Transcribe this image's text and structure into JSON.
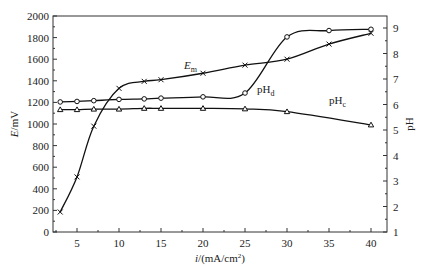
{
  "chart_data": {
    "type": "line",
    "title": "",
    "xlabel": "i/(mA/cm²)",
    "ylabel": "E/mV",
    "ylabel_right": "pH",
    "xlim": [
      2,
      42
    ],
    "ylim": [
      0,
      2000
    ],
    "ylim_right": [
      1,
      9.47
    ],
    "x_ticks": [
      5,
      10,
      15,
      20,
      25,
      30,
      35,
      40
    ],
    "y_ticks": [
      0,
      200,
      400,
      600,
      800,
      1000,
      1200,
      1400,
      1600,
      1800,
      2000
    ],
    "y_ticks_right": [
      1,
      2,
      3,
      4,
      5,
      6,
      7,
      8,
      9
    ],
    "grid": false,
    "legend": "inline labels",
    "series": [
      {
        "name": "E_m",
        "label_main": "E",
        "label_sub": "m",
        "axis": "left",
        "marker": "x",
        "x": [
          3,
          5,
          7,
          10,
          13,
          15,
          20,
          25,
          30,
          35,
          40
        ],
        "values": [
          185,
          510,
          980,
          1330,
          1395,
          1410,
          1470,
          1545,
          1600,
          1740,
          1840
        ]
      },
      {
        "name": "pH_d",
        "label_main": "pH",
        "label_sub": "d",
        "axis": "right",
        "marker": "circle",
        "x": [
          3,
          5,
          7,
          10,
          13,
          15,
          20,
          25,
          30,
          35,
          40
        ],
        "values": [
          6.1,
          6.12,
          6.15,
          6.2,
          6.22,
          6.25,
          6.3,
          6.45,
          8.65,
          8.9,
          8.95
        ]
      },
      {
        "name": "pH_c",
        "label_main": "pH",
        "label_sub": "c",
        "axis": "right",
        "marker": "triangle",
        "x": [
          3,
          5,
          7,
          10,
          13,
          15,
          20,
          25,
          30,
          40
        ],
        "values": [
          5.8,
          5.8,
          5.82,
          5.82,
          5.85,
          5.85,
          5.85,
          5.83,
          5.72,
          5.2
        ]
      }
    ]
  }
}
